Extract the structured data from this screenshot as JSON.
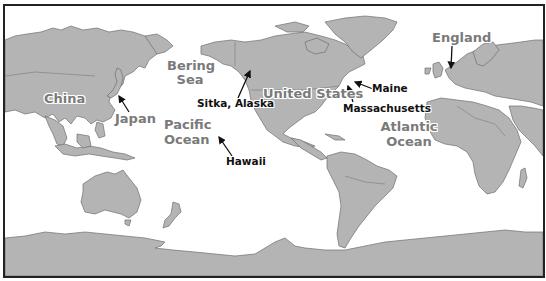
{
  "map": {
    "colors": {
      "land": "#b4b4b4",
      "coast": "#6e6e6e",
      "ocean": "#ffffff",
      "frame": "#222222",
      "region_label": "#7a7a7a",
      "place_label": "#111111"
    },
    "region_labels": [
      {
        "id": "china",
        "text": "China"
      },
      {
        "id": "bering_sea_line1",
        "text": "Bering"
      },
      {
        "id": "bering_sea_line2",
        "text": "Sea"
      },
      {
        "id": "japan",
        "text": "Japan"
      },
      {
        "id": "pacific_line1",
        "text": "Pacific"
      },
      {
        "id": "pacific_line2",
        "text": "Ocean"
      },
      {
        "id": "united_states",
        "text": "United States"
      },
      {
        "id": "atlantic_line1",
        "text": "Atlantic"
      },
      {
        "id": "atlantic_line2",
        "text": "Ocean"
      },
      {
        "id": "england",
        "text": "England"
      }
    ],
    "place_labels": [
      {
        "id": "sitka",
        "text": "Sitka, Alaska"
      },
      {
        "id": "hawaii",
        "text": "Hawaii"
      },
      {
        "id": "maine",
        "text": "Maine"
      },
      {
        "id": "massachusetts",
        "text": "Massachusetts"
      }
    ]
  }
}
